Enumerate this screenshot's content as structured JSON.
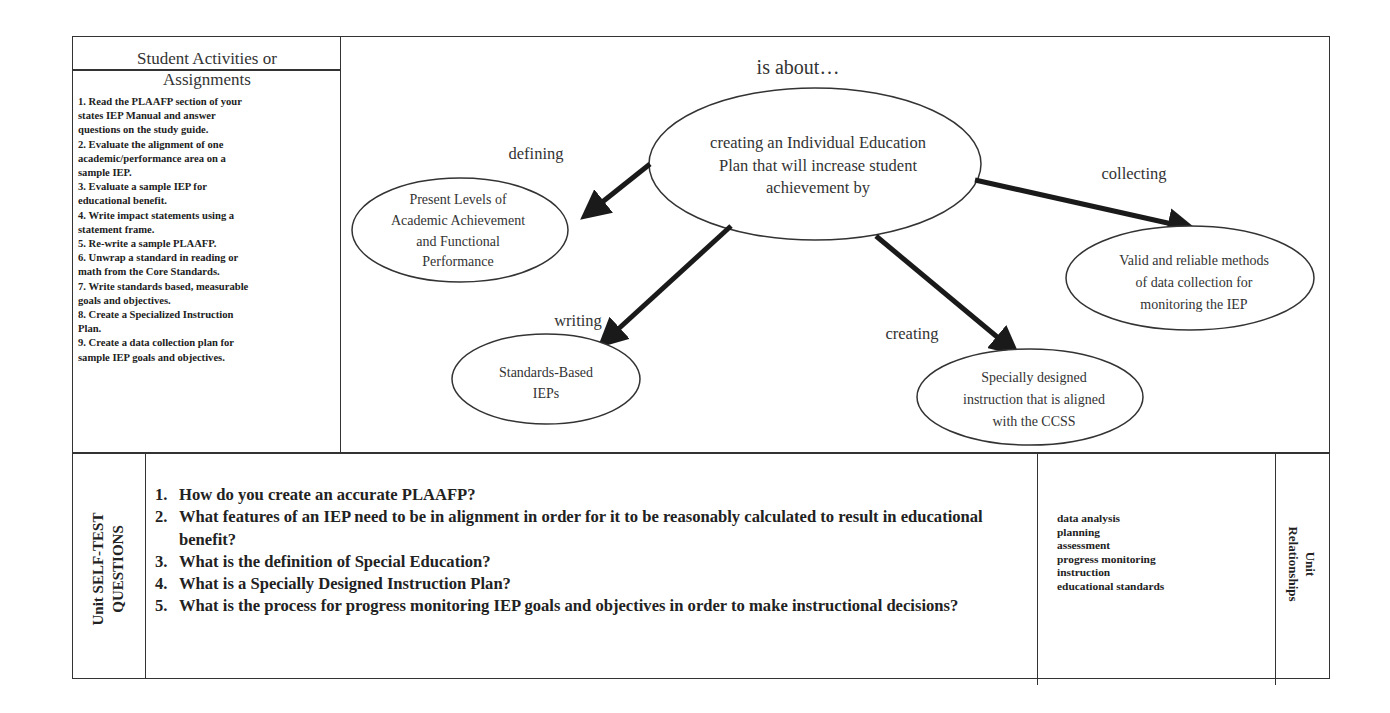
{
  "activities": {
    "title_line1": "Student Activities or",
    "title_line2": "Assignments",
    "items": [
      "1. Read the PLAAFP section of your",
      "states IEP Manual and answer",
      "questions on the study guide.",
      "2.  Evaluate the alignment of one",
      "academic/performance area on a",
      "sample IEP.",
      "3.  Evaluate a sample IEP for",
      "educational benefit.",
      "4.  Write impact statements using a",
      "statement frame.",
      "5.  Re-write a sample PLAAFP.",
      "6.  Unwrap a standard in reading or",
      "math from the Core Standards.",
      "7.  Write standards based, measurable",
      "goals and objectives.",
      "8. Create a Specialized Instruction",
      "Plan.",
      "9. Create a data collection plan for",
      "sample IEP goals and objectives."
    ]
  },
  "concept_map": {
    "heading": "is about…",
    "center": {
      "lines": [
        "creating an Individual Education",
        "Plan that will increase student",
        "achievement by"
      ]
    },
    "branches": [
      {
        "link": "defining",
        "node_lines": [
          "Present Levels of",
          "Academic Achievement",
          "and Functional",
          "Performance"
        ]
      },
      {
        "link": "writing",
        "node_lines": [
          "Standards-Based",
          "IEPs"
        ]
      },
      {
        "link": "creating",
        "node_lines": [
          "Specially designed",
          "instruction that is aligned",
          "with the CCSS"
        ]
      },
      {
        "link": "collecting",
        "node_lines": [
          "Valid and reliable methods",
          "of data collection for",
          "monitoring the IEP"
        ]
      }
    ]
  },
  "self_test": {
    "label_line1": "Unit SELF-TEST",
    "label_line2": "QUESTIONS",
    "questions": [
      {
        "num": "1.",
        "text": "How do you create an accurate PLAAFP?"
      },
      {
        "num": "2.",
        "text": "What features of an IEP need to be in alignment in order for it to be reasonably calculated to result in educational benefit?"
      },
      {
        "num": "3.",
        "text": "What is the definition of Special Education?"
      },
      {
        "num": "4.",
        "text": "What is a Specially Designed Instruction Plan?"
      },
      {
        "num": "5.",
        "text": "What is the process for progress monitoring IEP goals and objectives in order to make instructional decisions?"
      }
    ]
  },
  "relationships": {
    "label_line1": "Unit",
    "label_line2": "Relationships",
    "items": [
      "data analysis",
      "planning",
      "assessment",
      "progress monitoring",
      "instruction",
      "educational standards"
    ]
  }
}
